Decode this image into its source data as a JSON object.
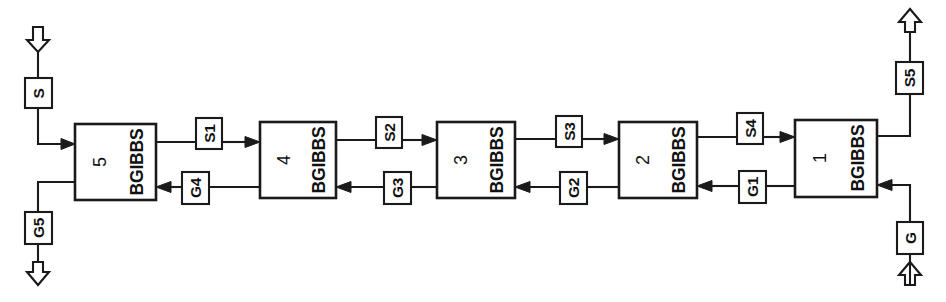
{
  "diagram": {
    "orientation": "rotated-90",
    "background_color": "#ffffff",
    "line_color": "#1a1a1a",
    "units": [
      {
        "id": "unit-5",
        "name": "BGIBBS",
        "number": "5"
      },
      {
        "id": "unit-4",
        "name": "BGIBBS",
        "number": "4"
      },
      {
        "id": "unit-3",
        "name": "BGIBBS",
        "number": "3"
      },
      {
        "id": "unit-2",
        "name": "BGIBBS",
        "number": "2"
      },
      {
        "id": "unit-1",
        "name": "BGIBBS",
        "number": "1"
      }
    ],
    "feed_streams": [
      {
        "id": "stream-S",
        "label": "S",
        "kind": "inlet",
        "side": "left-top",
        "arrow": "hollow-down"
      },
      {
        "id": "stream-G",
        "label": "G",
        "kind": "inlet",
        "side": "right-bottom",
        "arrow": "hollow-up"
      }
    ],
    "product_streams": [
      {
        "id": "stream-G5",
        "label": "G5",
        "kind": "outlet",
        "side": "left-bottom",
        "arrow": "hollow-down"
      },
      {
        "id": "stream-S5",
        "label": "S5",
        "kind": "outlet",
        "side": "right-top",
        "arrow": "hollow-up"
      }
    ],
    "interstage_streams_top": [
      {
        "id": "stream-S1",
        "label": "S1",
        "from": "5",
        "to": "4",
        "direction": "right"
      },
      {
        "id": "stream-S2",
        "label": "S2",
        "from": "4",
        "to": "3",
        "direction": "right"
      },
      {
        "id": "stream-S3",
        "label": "S3",
        "from": "3",
        "to": "2",
        "direction": "right"
      },
      {
        "id": "stream-S4",
        "label": "S4",
        "from": "2",
        "to": "1",
        "direction": "right"
      }
    ],
    "interstage_streams_bottom": [
      {
        "id": "stream-G4",
        "label": "G4",
        "from": "4",
        "to": "5",
        "direction": "left"
      },
      {
        "id": "stream-G3",
        "label": "G3",
        "from": "3",
        "to": "4",
        "direction": "left"
      },
      {
        "id": "stream-G2",
        "label": "G2",
        "from": "2",
        "to": "3",
        "direction": "left"
      },
      {
        "id": "stream-G1",
        "label": "G1",
        "from": "1",
        "to": "2",
        "direction": "left"
      }
    ]
  }
}
